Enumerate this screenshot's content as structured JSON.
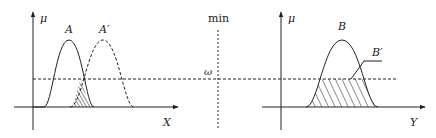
{
  "figure": {
    "left_panel": {
      "y_axis_label": "μ",
      "x_axis_label": "X",
      "curve_A_label": "A",
      "curve_A_prime_label": "A′"
    },
    "center": {
      "operator_label": "min",
      "omega_label": "ω"
    },
    "right_panel": {
      "y_axis_label": "μ",
      "x_axis_label": "Y",
      "curve_B_label": "B",
      "clipped_label": "B′"
    },
    "colors": {
      "stroke": "#222222",
      "background": "#ffffff"
    }
  }
}
